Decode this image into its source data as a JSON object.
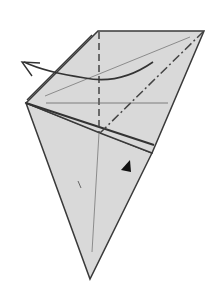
{
  "diagram": {
    "type": "origami-fold-step",
    "colors": {
      "background": "#ffffff",
      "paper": "#d9d9d9",
      "edge": "#3a3a3a",
      "crease": "#555555",
      "arrow": "#333333"
    },
    "instruction": {
      "arrow": "curved-arrow-left",
      "marker": "push-triangle"
    }
  }
}
